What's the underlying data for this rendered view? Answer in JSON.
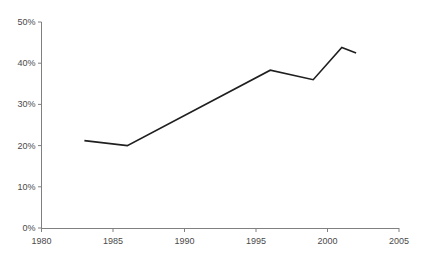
{
  "chart_data": {
    "type": "line",
    "title": "",
    "subtitle": "",
    "xlabel": "",
    "ylabel": "",
    "xlim": [
      1980,
      2005
    ],
    "ylim": [
      0,
      50
    ],
    "grid": false,
    "legend": null,
    "x_ticks": [
      1980,
      1985,
      1990,
      1995,
      2000,
      2005
    ],
    "x_tick_labels": [
      "1980",
      "1985",
      "1990",
      "1995",
      "2000",
      "2005"
    ],
    "y_ticks": [
      0,
      10,
      20,
      30,
      40,
      50
    ],
    "y_tick_labels": [
      "0%",
      "10%",
      "20%",
      "30%",
      "40%",
      "50%"
    ],
    "series": [
      {
        "name": "",
        "color": "#1f1f1f",
        "x": [
          1983,
          1986,
          1996,
          1999,
          2001,
          2002
        ],
        "values": [
          21.2,
          20.0,
          38.3,
          36.0,
          43.8,
          42.5
        ],
        "points": [
          {
            "x": 1983,
            "y": 21.2
          },
          {
            "x": 1986,
            "y": 20.0
          },
          {
            "x": 1996,
            "y": 38.3
          },
          {
            "x": 1999,
            "y": 36.0
          },
          {
            "x": 2001,
            "y": 43.8
          },
          {
            "x": 2002,
            "y": 42.5
          }
        ]
      }
    ],
    "annotations": []
  },
  "style": {
    "axis_color": "#808080",
    "line_color": "#1f1f1f",
    "label_color": "#4a4a4a",
    "background": "#ffffff",
    "line_width": 1.6
  }
}
